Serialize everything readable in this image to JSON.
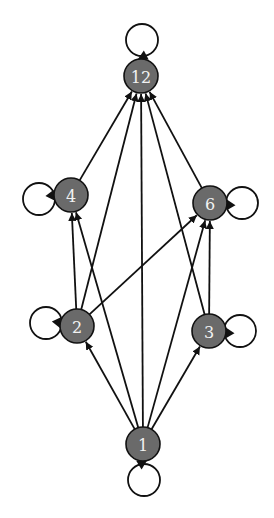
{
  "diagram": {
    "type": "directed-graph",
    "nodes": [
      {
        "id": "12",
        "label": "12",
        "x": 141,
        "y": 76
      },
      {
        "id": "4",
        "label": "4",
        "x": 71,
        "y": 195
      },
      {
        "id": "6",
        "label": "6",
        "x": 210,
        "y": 203
      },
      {
        "id": "2",
        "label": "2",
        "x": 77,
        "y": 326
      },
      {
        "id": "3",
        "label": "3",
        "x": 209,
        "y": 331
      },
      {
        "id": "1",
        "label": "1",
        "x": 143,
        "y": 444
      }
    ],
    "edges": [
      [
        "1",
        "2"
      ],
      [
        "1",
        "3"
      ],
      [
        "1",
        "4"
      ],
      [
        "1",
        "6"
      ],
      [
        "1",
        "12"
      ],
      [
        "2",
        "4"
      ],
      [
        "2",
        "6"
      ],
      [
        "2",
        "12"
      ],
      [
        "3",
        "6"
      ],
      [
        "3",
        "12"
      ],
      [
        "4",
        "12"
      ],
      [
        "6",
        "12"
      ]
    ],
    "self_loops": [
      "1",
      "2",
      "3",
      "4",
      "6",
      "12"
    ],
    "colors": {
      "node_fill": "#6a6a6a",
      "node_text": "#f2f2f2",
      "stroke": "#111111"
    }
  }
}
